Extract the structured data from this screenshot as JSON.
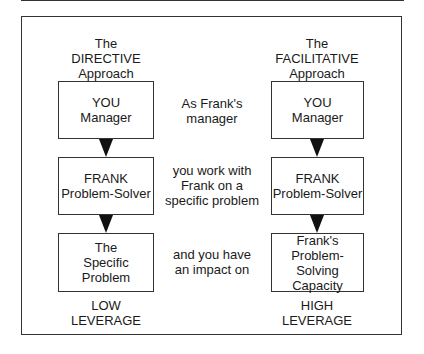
{
  "diagram": {
    "left": {
      "heading": "The\nDIRECTIVE\nApproach",
      "boxes": [
        "YOU\nManager",
        "FRANK\nProblem-Solver",
        "The\nSpecific\nProblem"
      ],
      "footer": "LOW\nLEVERAGE"
    },
    "middle": {
      "captions": [
        "As Frank's\nmanager",
        "you work with\nFrank on a\nspecific problem",
        "and you have\nan impact on"
      ]
    },
    "right": {
      "heading": "The\nFACILITATIVE\nApproach",
      "boxes": [
        "YOU\nManager",
        "FRANK\nProblem-Solver",
        "Frank's\nProblem-Solving\nCapacity"
      ],
      "footer": "HIGH\nLEVERAGE"
    },
    "colors": {
      "line": "#333333",
      "arrow": "#111111",
      "text": "#1a1a1a"
    }
  }
}
